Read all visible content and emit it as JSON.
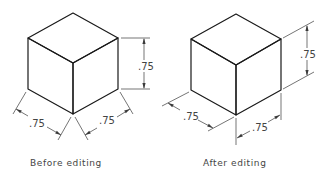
{
  "figure": {
    "left_panel": {
      "caption": "Before editing",
      "dimensions": {
        "height": ".75",
        "left_width": ".75",
        "right_width": ".75"
      },
      "dimension_style": "aligned extension lines (horizontal for height)"
    },
    "right_panel": {
      "caption": "After editing",
      "dimensions": {
        "height": ".75",
        "left_width": ".75",
        "right_width": ".75"
      },
      "dimension_style": "oblique extension lines (isometric aligned)"
    },
    "colors": {
      "line": "#1a1a1a",
      "dimension": "#3a3a3a",
      "text": "#444444",
      "background": "#ffffff"
    }
  }
}
